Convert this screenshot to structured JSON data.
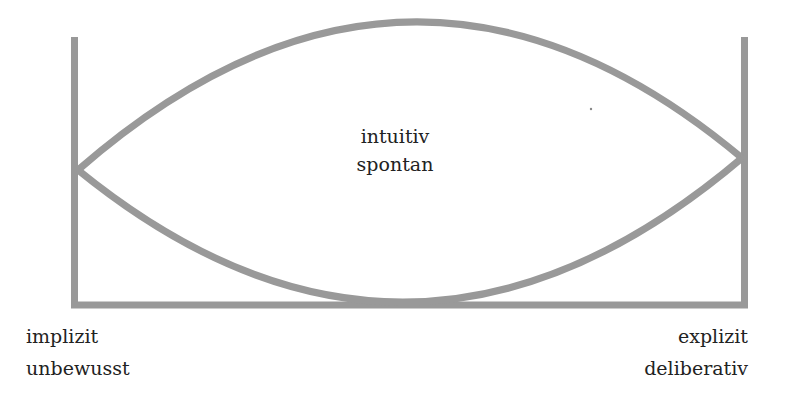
{
  "diagram": {
    "type": "lens-over-baseline",
    "stroke_color": "#999999",
    "text_color": "#222222",
    "center": {
      "line1": "intuitiv",
      "line2": "spontan"
    },
    "left_pole": {
      "line1": "implizit",
      "line2": "unbewusst"
    },
    "right_pole": {
      "line1": "explizit",
      "line2": "deliberativ"
    }
  }
}
